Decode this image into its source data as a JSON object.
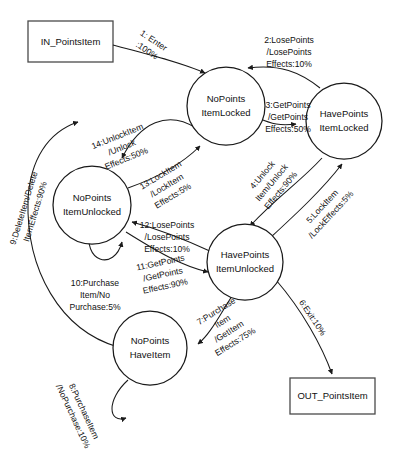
{
  "diagram": {
    "colors": {
      "stroke": "#1a1a1a",
      "background": "#ffffff",
      "terminal_stroke": "#4a4a4a"
    },
    "terminals": [
      {
        "id": "in",
        "label": "IN_PointsItem"
      },
      {
        "id": "out",
        "label": "OUT_PointsItem"
      }
    ],
    "states": [
      {
        "id": "no_points_item_locked",
        "line1": "NoPoints",
        "line2": "ItemLocked"
      },
      {
        "id": "have_points_item_locked",
        "line1": "HavePoints",
        "line2": "ItemLocked"
      },
      {
        "id": "no_points_item_unlocked",
        "line1": "NoPoints",
        "line2": "ItemUnlocked"
      },
      {
        "id": "have_points_item_unlocked",
        "line1": "HavePoints",
        "line2": "ItemUnlocked"
      },
      {
        "id": "no_points_have_item",
        "line1": "NoPoints",
        "line2": "HaveItem"
      }
    ],
    "transitions": [
      {
        "num": "1",
        "l1": "1: Enter",
        "l2": ":100%",
        "l3": ""
      },
      {
        "num": "2",
        "l1": "2:LosePoints",
        "l2": "/LosePoints",
        "l3": "Effects:10%"
      },
      {
        "num": "3",
        "l1": "3:GetPoints",
        "l2": "/GetPoints",
        "l3": "Effects:50%"
      },
      {
        "num": "4",
        "l1": "4:Unlock",
        "l2": "Item/Unlock",
        "l3": "Effects:90%"
      },
      {
        "num": "5",
        "l1": "5:LockItem",
        "l2": "/LockEffects:5%",
        "l3": ""
      },
      {
        "num": "6",
        "l1": "6:Exit:10%",
        "l2": "",
        "l3": ""
      },
      {
        "num": "7",
        "l1": "7:Purchase",
        "l2": "Item",
        "l3": "/GetItem",
        "l4": "Effects:75%"
      },
      {
        "num": "8",
        "l1": "8:PurchaseItem",
        "l2": "/NoPurchase:10%",
        "l3": ""
      },
      {
        "num": "9",
        "l1": "9:DeleteItem/Delete",
        "l2": "ItemEffects:90%",
        "l3": ""
      },
      {
        "num": "10",
        "l1": "10:Purchase",
        "l2": "Item/No",
        "l3": "Purchase:5%"
      },
      {
        "num": "11",
        "l1": "11:GetPoints",
        "l2": "/GetPoints",
        "l3": "Effects:90%"
      },
      {
        "num": "12",
        "l1": "12:LosePoints",
        "l2": "/LosePoints",
        "l3": "Effects:10%"
      },
      {
        "num": "13",
        "l1": "13:LockItem",
        "l2": "/LockItem",
        "l3": "Effects:5%"
      },
      {
        "num": "14",
        "l1": "14:UnlockItem",
        "l2": "/Unlock",
        "l3": "Effects:50%"
      }
    ]
  }
}
